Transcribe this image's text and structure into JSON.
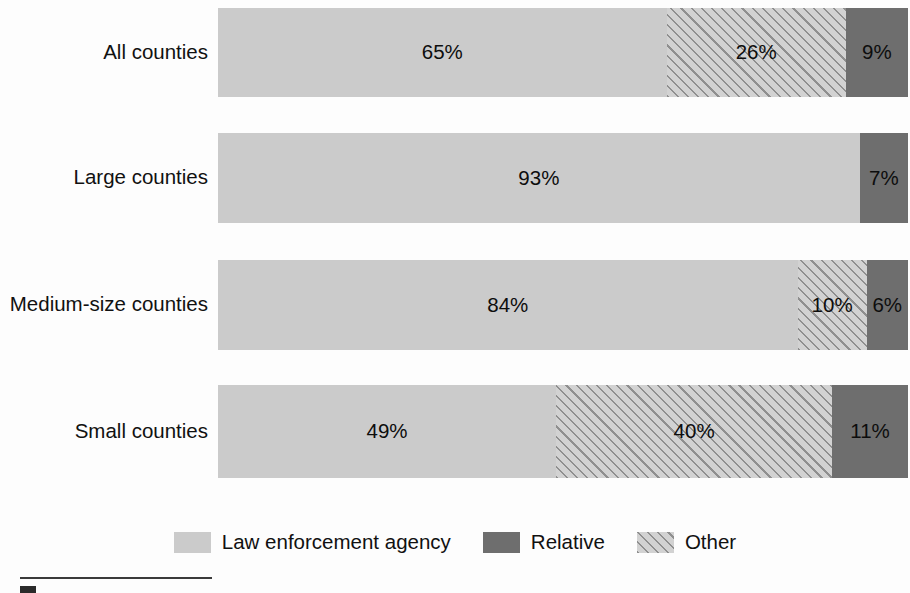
{
  "chart_data": {
    "type": "bar",
    "orientation": "horizontal",
    "stacked": true,
    "stacked_percent": true,
    "title": "",
    "subtitle": "",
    "xlabel": "",
    "ylabel": "",
    "xlim": [
      0,
      100
    ],
    "grid": false,
    "legend_position": "bottom-center",
    "categories": [
      "All counties",
      "Large counties",
      "Medium-size counties",
      "Small counties"
    ],
    "series": [
      {
        "name": "Law enforcement agency",
        "swatch": "law",
        "color": "#cbcbcb",
        "values": [
          65,
          93,
          84,
          49
        ],
        "labels": [
          "65%",
          "93%",
          "84%",
          "49%"
        ]
      },
      {
        "name": "Other",
        "swatch": "other",
        "color": "#d2d2d2",
        "pattern": "diagonal-hatch",
        "values": [
          26,
          0,
          10,
          40
        ],
        "labels": [
          "26%",
          "",
          "10%",
          "40%"
        ]
      },
      {
        "name": "Relative",
        "swatch": "relative",
        "color": "#6e6e6e",
        "values": [
          9,
          7,
          6,
          11
        ],
        "labels": [
          "9%",
          "7%",
          "6%",
          "11%"
        ]
      }
    ]
  },
  "bars": [
    {
      "label": "All counties",
      "segments": [
        {
          "key": "law",
          "value": 65,
          "label": "65%"
        },
        {
          "key": "other",
          "value": 26,
          "label": "26%"
        },
        {
          "key": "relative",
          "value": 9,
          "label": "9%"
        }
      ]
    },
    {
      "label": "Large counties",
      "segments": [
        {
          "key": "law",
          "value": 93,
          "label": "93%"
        },
        {
          "key": "other",
          "value": 0,
          "label": ""
        },
        {
          "key": "relative",
          "value": 7,
          "label": "7%"
        }
      ]
    },
    {
      "label": "Medium-size counties",
      "segments": [
        {
          "key": "law",
          "value": 84,
          "label": "84%"
        },
        {
          "key": "other",
          "value": 10,
          "label": "10%"
        },
        {
          "key": "relative",
          "value": 6,
          "label": "6%"
        }
      ]
    },
    {
      "label": "Small counties",
      "segments": [
        {
          "key": "law",
          "value": 49,
          "label": "49%"
        },
        {
          "key": "other",
          "value": 40,
          "label": "40%"
        },
        {
          "key": "relative",
          "value": 11,
          "label": "11%"
        }
      ]
    }
  ],
  "legend": {
    "items": [
      {
        "key": "law",
        "label": "Law enforcement agency"
      },
      {
        "key": "relative",
        "label": "Relative"
      },
      {
        "key": "other",
        "label": "Other"
      }
    ]
  },
  "colors": {
    "law_enforcement_agency": "#cbcbcb",
    "relative": "#6e6e6e",
    "other": "#d2d2d2",
    "other_hatch": "#8f8f8f",
    "text": "#111111",
    "background": "#fdfdfd",
    "rule": "#3a3a3a"
  },
  "footnote": {
    "rule_present": true,
    "marker_present": true
  },
  "bar_geometry": [
    {
      "top": 8,
      "height": 89
    },
    {
      "top": 133,
      "height": 90
    },
    {
      "top": 260,
      "height": 90
    },
    {
      "top": 385,
      "height": 93
    }
  ]
}
